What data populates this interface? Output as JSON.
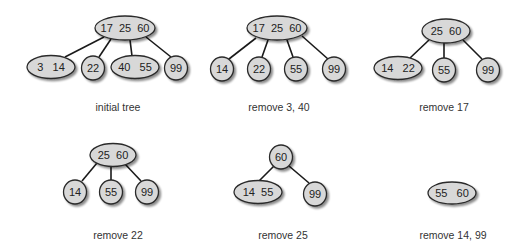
{
  "diagram": {
    "colors": {
      "node_fill": "#d8d8d8",
      "node_stroke": "#2a2a2a",
      "edge": "#1a1a1a",
      "shadow": "#9a9a9a",
      "text": "#222222"
    },
    "panels": [
      {
        "id": "initial",
        "caption": "initial tree",
        "caption_pos": [
          118,
          111
        ],
        "nodes": [
          {
            "id": "r",
            "keys": "17  25  60",
            "cx": 125,
            "cy": 28,
            "rx": 30,
            "ry": 12
          },
          {
            "id": "a",
            "keys": "3   14",
            "cx": 51,
            "cy": 67,
            "rx": 24,
            "ry": 11.5
          },
          {
            "id": "b",
            "keys": "22",
            "cx": 93,
            "cy": 68,
            "rx": 11.5,
            "ry": 12
          },
          {
            "id": "c",
            "keys": "40   55",
            "cx": 135,
            "cy": 67,
            "rx": 24,
            "ry": 11.5
          },
          {
            "id": "d",
            "keys": "99",
            "cx": 176,
            "cy": 68,
            "rx": 11.5,
            "ry": 12
          }
        ],
        "edges": [
          [
            "r",
            "a"
          ],
          [
            "r",
            "b"
          ],
          [
            "r",
            "c"
          ],
          [
            "r",
            "d"
          ]
        ],
        "edge_points": [
          [
            [
              104,
              37
            ],
            [
              65,
              57
            ]
          ],
          [
            [
              111,
              39
            ],
            [
              99,
              57
            ]
          ],
          [
            [
              130,
              40
            ],
            [
              132,
              56
            ]
          ],
          [
            [
              146,
              37
            ],
            [
              171,
              57
            ]
          ]
        ]
      },
      {
        "id": "remove-3-40",
        "caption": "remove 3, 40",
        "caption_pos": [
          279,
          111
        ],
        "nodes": [
          {
            "id": "r",
            "keys": "17  25  60",
            "cx": 277,
            "cy": 28,
            "rx": 30,
            "ry": 12
          },
          {
            "id": "a",
            "keys": "14",
            "cx": 222,
            "cy": 69,
            "rx": 11.5,
            "ry": 12
          },
          {
            "id": "b",
            "keys": "22",
            "cx": 259,
            "cy": 69,
            "rx": 11.5,
            "ry": 12
          },
          {
            "id": "c",
            "keys": "55",
            "cx": 296,
            "cy": 69,
            "rx": 11.5,
            "ry": 12
          },
          {
            "id": "d",
            "keys": "99",
            "cx": 334,
            "cy": 69,
            "rx": 11.5,
            "ry": 12
          }
        ],
        "edges": [
          [
            "r",
            "a"
          ],
          [
            "r",
            "b"
          ],
          [
            "r",
            "c"
          ],
          [
            "r",
            "d"
          ]
        ],
        "edge_points": [
          [
            [
              256,
              38
            ],
            [
              229,
              59
            ]
          ],
          [
            [
              268,
              40
            ],
            [
              262,
              57
            ]
          ],
          [
            [
              287,
              40
            ],
            [
              293,
              57
            ]
          ],
          [
            [
              302,
              36
            ],
            [
              328,
              59
            ]
          ]
        ]
      },
      {
        "id": "remove-17",
        "caption": "remove 17",
        "caption_pos": [
          444,
          111
        ],
        "nodes": [
          {
            "id": "r",
            "keys": "25  60",
            "cx": 446,
            "cy": 31,
            "rx": 24,
            "ry": 12
          },
          {
            "id": "a",
            "keys": "14   22",
            "cx": 398,
            "cy": 68,
            "rx": 24,
            "ry": 11.5
          },
          {
            "id": "b",
            "keys": "55",
            "cx": 444,
            "cy": 70,
            "rx": 11.5,
            "ry": 12
          },
          {
            "id": "c",
            "keys": "99",
            "cx": 488,
            "cy": 70,
            "rx": 11.5,
            "ry": 12
          }
        ],
        "edges": [
          [
            "r",
            "a"
          ],
          [
            "r",
            "b"
          ],
          [
            "r",
            "c"
          ]
        ],
        "edge_points": [
          [
            [
              429,
              40
            ],
            [
              410,
              58
            ]
          ],
          [
            [
              444,
              43
            ],
            [
              444,
              58
            ]
          ],
          [
            [
              463,
              40
            ],
            [
              482,
              59
            ]
          ]
        ]
      },
      {
        "id": "remove-22",
        "caption": "remove 22",
        "caption_pos": [
          118,
          239
        ],
        "nodes": [
          {
            "id": "r",
            "keys": "25  60",
            "cx": 113,
            "cy": 155,
            "rx": 23,
            "ry": 11.5
          },
          {
            "id": "a",
            "keys": "14",
            "cx": 75,
            "cy": 192,
            "rx": 11.5,
            "ry": 12
          },
          {
            "id": "b",
            "keys": "55",
            "cx": 111,
            "cy": 192,
            "rx": 11.5,
            "ry": 12
          },
          {
            "id": "c",
            "keys": "99",
            "cx": 147,
            "cy": 192,
            "rx": 11.5,
            "ry": 12
          }
        ],
        "edges": [
          [
            "r",
            "a"
          ],
          [
            "r",
            "b"
          ],
          [
            "r",
            "c"
          ]
        ],
        "edge_points": [
          [
            [
              97,
              163
            ],
            [
              82,
              181
            ]
          ],
          [
            [
              111,
              167
            ],
            [
              111,
              180
            ]
          ],
          [
            [
              125,
              164
            ],
            [
              141,
              181
            ]
          ]
        ]
      },
      {
        "id": "remove-25",
        "caption": "remove 25",
        "caption_pos": [
          283,
          239
        ],
        "nodes": [
          {
            "id": "r",
            "keys": "60",
            "cx": 281,
            "cy": 157,
            "rx": 11.5,
            "ry": 12
          },
          {
            "id": "a",
            "keys": "14  55",
            "cx": 258,
            "cy": 192,
            "rx": 24,
            "ry": 11.5
          },
          {
            "id": "b",
            "keys": "99",
            "cx": 315,
            "cy": 194,
            "rx": 11.5,
            "ry": 12
          }
        ],
        "edges": [
          [
            "r",
            "a"
          ],
          [
            "r",
            "b"
          ]
        ],
        "edge_points": [
          [
            [
              274,
              166
            ],
            [
              259,
              181
            ]
          ],
          [
            [
              289,
              166
            ],
            [
              309,
              183
            ]
          ]
        ]
      },
      {
        "id": "remove-14-99",
        "caption": "remove 14, 99",
        "caption_pos": [
          453,
          239
        ],
        "nodes": [
          {
            "id": "r",
            "keys": "55   60",
            "cx": 452,
            "cy": 193,
            "rx": 24,
            "ry": 11
          }
        ],
        "edges": [],
        "edge_points": []
      }
    ]
  }
}
